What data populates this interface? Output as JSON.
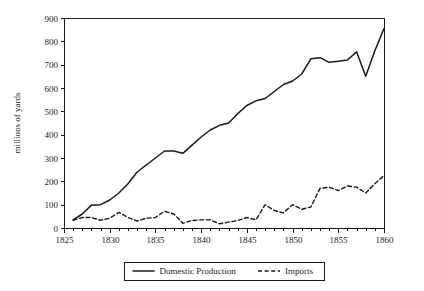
{
  "chart_data": {
    "type": "line",
    "title": "",
    "xlabel": "",
    "ylabel": "millions of yards",
    "xlim": [
      1825,
      1860
    ],
    "ylim": [
      0,
      900
    ],
    "grid": false,
    "legend_position": "bottom-center",
    "x_ticks": [
      1825,
      1830,
      1835,
      1840,
      1845,
      1850,
      1855,
      1860
    ],
    "x_tick_labels": [
      "1825",
      "1830",
      "1835",
      "1840",
      "1845",
      "1850",
      "1855",
      "1860"
    ],
    "x_minor_tick_step": 1,
    "y_ticks": [
      0,
      100,
      200,
      300,
      400,
      500,
      600,
      700,
      800,
      900
    ],
    "y_tick_labels": [
      "0",
      "100",
      "200",
      "300",
      "400",
      "500",
      "600",
      "700",
      "800",
      "900"
    ],
    "x": [
      1826,
      1827,
      1828,
      1829,
      1830,
      1831,
      1832,
      1833,
      1834,
      1835,
      1836,
      1837,
      1838,
      1839,
      1840,
      1841,
      1842,
      1843,
      1844,
      1845,
      1846,
      1847,
      1848,
      1849,
      1850,
      1851,
      1852,
      1853,
      1854,
      1855,
      1856,
      1857,
      1858,
      1859,
      1860
    ],
    "series": [
      {
        "name": "Domestic Production",
        "style": "solid",
        "color": "#1a1a1a",
        "values": [
          35,
          60,
          98,
          100,
          120,
          150,
          190,
          240,
          270,
          300,
          330,
          330,
          320,
          355,
          390,
          420,
          440,
          450,
          490,
          525,
          545,
          555,
          585,
          615,
          630,
          660,
          725,
          730,
          710,
          715,
          720,
          755,
          650,
          760,
          855
        ]
      },
      {
        "name": "Imports",
        "style": "dashed",
        "color": "#1a1a1a",
        "values": [
          33,
          45,
          45,
          33,
          42,
          67,
          45,
          30,
          42,
          45,
          72,
          60,
          20,
          32,
          35,
          35,
          18,
          25,
          32,
          45,
          35,
          100,
          75,
          65,
          100,
          80,
          90,
          170,
          175,
          160,
          180,
          175,
          150,
          190,
          225
        ]
      }
    ],
    "legend": [
      {
        "label": "Domestic Production",
        "style": "solid"
      },
      {
        "label": "Imports",
        "style": "dashed"
      }
    ]
  }
}
